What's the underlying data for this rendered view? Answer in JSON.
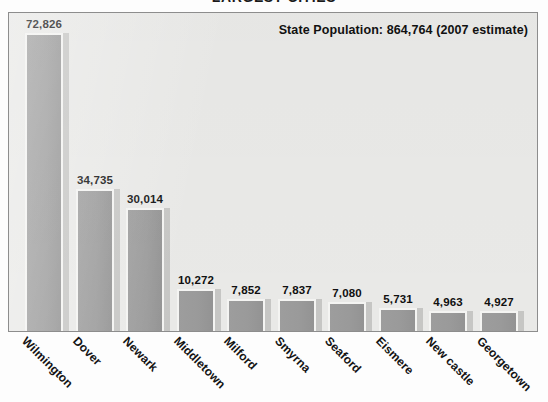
{
  "chart_data": {
    "type": "bar",
    "title": "LARGEST CITIES",
    "subtitle": "",
    "annotation": "State Population: 864,764 (2007 estimate)",
    "xlabel": "",
    "ylabel": "",
    "ylim": [
      0,
      80000
    ],
    "grid": false,
    "legend": "none",
    "categories": [
      "Wilmington",
      "Dover",
      "Newark",
      "Middletown",
      "Milford",
      "Smyrna",
      "Seaford",
      "Eismere",
      "New castle",
      "Georgetown"
    ],
    "values": [
      72826,
      34735,
      30014,
      10272,
      7852,
      7837,
      7080,
      5731,
      4963,
      4927
    ],
    "value_labels": [
      "72,826",
      "34,735",
      "30,014",
      "10,272",
      "7,852",
      "7,837",
      "7,080",
      "5,731",
      "4,963",
      "4,927"
    ]
  },
  "colors": {
    "bar_fill": "#9a9a9a",
    "bar_outline": "#f4f4f2",
    "bar_shadow": "#c6c6c4",
    "plot_background": "#e9e9e7",
    "plot_border": "#8d8d8d",
    "text": "#101010",
    "page_background": "#fdfdfd"
  }
}
